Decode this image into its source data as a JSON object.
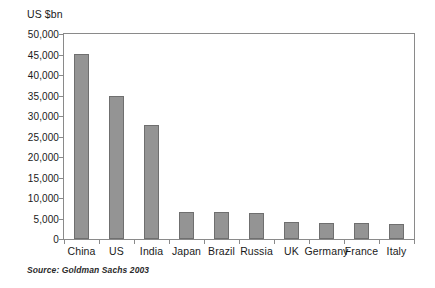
{
  "chart_data": {
    "type": "bar",
    "title": "",
    "subtitle": "",
    "xlabel": "",
    "ylabel": "US $bn",
    "ylim": [
      0,
      50000
    ],
    "ytick_step": 5000,
    "grid": false,
    "legend": "none",
    "bar_color": "#949494",
    "bar_border_color": "#6f6f6f",
    "axis_color": "#8a8a8a",
    "categories": [
      "China",
      "US",
      "India",
      "Japan",
      "Brazil",
      "Russia",
      "UK",
      "Germany",
      "France",
      "Italy"
    ],
    "values": [
      45200,
      35000,
      27800,
      6700,
      6500,
      6300,
      4100,
      4000,
      3800,
      3600
    ],
    "ytick_labels": [
      "50,000",
      "45,000",
      "40,000",
      "35,000",
      "30,000",
      "25,000",
      "20,000",
      "15,000",
      "10,000",
      "5,000",
      "0"
    ],
    "ytick_values": [
      50000,
      45000,
      40000,
      35000,
      30000,
      25000,
      20000,
      15000,
      10000,
      5000,
      0
    ],
    "annotations": [
      "Source:  Goldman Sachs 2003"
    ]
  },
  "figure": {
    "axis_title": "US $bn",
    "source_note": "Source:  Goldman Sachs 2003"
  }
}
